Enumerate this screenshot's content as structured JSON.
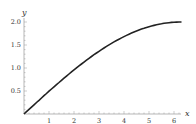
{
  "chart_data": {
    "type": "line",
    "title": "",
    "xlabel": "x",
    "ylabel": "y",
    "x_ticks": [
      "1",
      "2",
      "3",
      "4",
      "5",
      "6"
    ],
    "y_ticks": [
      "0.5",
      "1.0",
      "1.5",
      "2.0"
    ],
    "xlim": [
      0,
      6.35
    ],
    "ylim": [
      0,
      2.1
    ],
    "grid": false,
    "series": [
      {
        "name": "y = 2 sin(x/4)",
        "x": [
          0,
          0.5,
          1,
          1.5,
          2,
          2.5,
          3,
          3.5,
          4,
          4.5,
          5,
          5.5,
          6,
          6.28
        ],
        "values": [
          0,
          0.25,
          0.49,
          0.73,
          0.96,
          1.18,
          1.36,
          1.53,
          1.68,
          1.8,
          1.9,
          1.96,
          1.99,
          2.0
        ]
      }
    ]
  }
}
